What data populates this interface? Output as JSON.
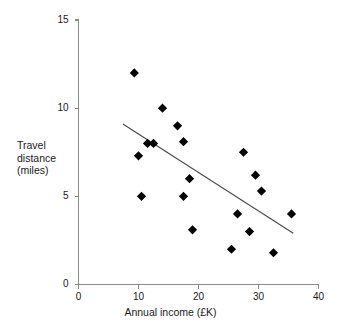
{
  "chart_data": {
    "type": "scatter",
    "title": "",
    "xlabel": "Annual income (£K)",
    "ylabel": "Travel distance (miles)",
    "ylabel_lines": [
      "Travel",
      "distance",
      "(miles)"
    ],
    "xlim": [
      0,
      40
    ],
    "ylim": [
      0,
      15
    ],
    "xticks": [
      0,
      10,
      20,
      30,
      40
    ],
    "yticks": [
      0,
      5,
      10,
      15
    ],
    "xtick_labels": [
      "0",
      "10",
      "20",
      "30",
      "40"
    ],
    "ytick_labels": [
      "0",
      "5",
      "10",
      "15"
    ],
    "grid": false,
    "legend": false,
    "marker": "diamond",
    "marker_color": "#000000",
    "points": [
      {
        "x": 9.3,
        "y": 12.0
      },
      {
        "x": 14.0,
        "y": 10.0
      },
      {
        "x": 16.5,
        "y": 9.0
      },
      {
        "x": 17.5,
        "y": 8.1
      },
      {
        "x": 11.5,
        "y": 8.0
      },
      {
        "x": 12.5,
        "y": 8.0
      },
      {
        "x": 10.0,
        "y": 7.3
      },
      {
        "x": 27.5,
        "y": 7.5
      },
      {
        "x": 18.5,
        "y": 6.0
      },
      {
        "x": 29.5,
        "y": 6.2
      },
      {
        "x": 30.5,
        "y": 5.3
      },
      {
        "x": 17.5,
        "y": 5.0
      },
      {
        "x": 10.5,
        "y": 5.0
      },
      {
        "x": 26.5,
        "y": 4.0
      },
      {
        "x": 35.5,
        "y": 4.0
      },
      {
        "x": 19.0,
        "y": 3.1
      },
      {
        "x": 28.5,
        "y": 3.0
      },
      {
        "x": 25.5,
        "y": 2.0
      },
      {
        "x": 32.5,
        "y": 1.8
      }
    ],
    "trendline": {
      "type": "linear",
      "x_start": 7.4,
      "y_start": 9.1,
      "x_end": 35.8,
      "y_end": 2.9,
      "color": "#4d4d4d"
    },
    "axis_color": "#8b8b8b"
  }
}
